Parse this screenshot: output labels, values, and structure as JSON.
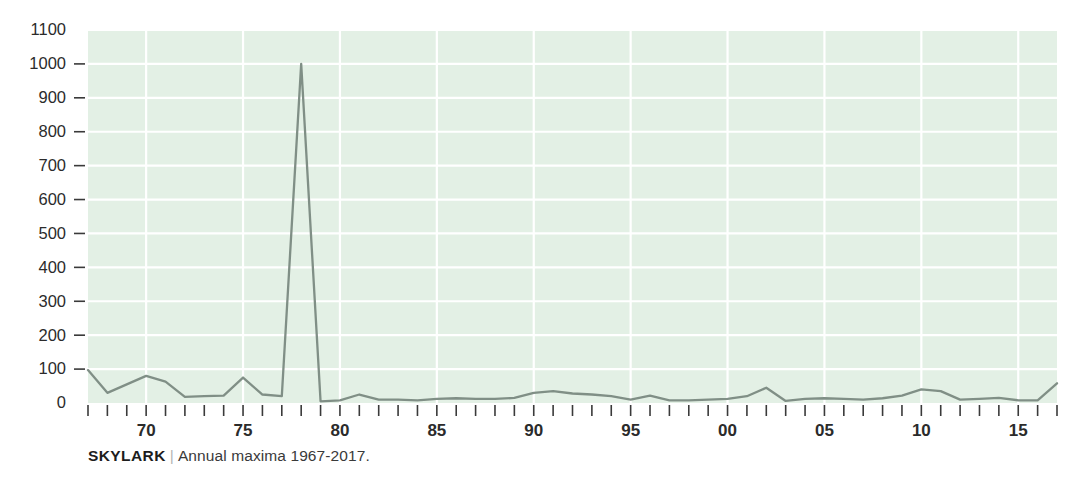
{
  "caption": {
    "title": "SKYLARK",
    "separator": "|",
    "subtitle": "Annual maxima 1967-2017."
  },
  "colors": {
    "plot_background": "#e3f0e5",
    "gridline": "#ffffff",
    "line": "#808f86",
    "axis_text": "#2b2b2b",
    "page_background": "#ffffff",
    "caption_title": "#1d1d1d",
    "caption_separator": "#b4b4b4"
  },
  "chart_data": {
    "type": "line",
    "title": "SKYLARK",
    "subtitle": "Annual maxima 1967-2017.",
    "xlabel": "",
    "ylabel": "",
    "grid": true,
    "legend": null,
    "ylim": [
      0,
      1100
    ],
    "xlim": [
      1967,
      2017
    ],
    "yticks": [
      0,
      100,
      200,
      300,
      400,
      500,
      600,
      700,
      800,
      900,
      1000,
      1100
    ],
    "ytick_labels": [
      "0",
      "100",
      "200",
      "300",
      "400",
      "500",
      "600",
      "700",
      "800",
      "900",
      "1000",
      "1100"
    ],
    "xticks": [
      1967,
      1968,
      1969,
      1970,
      1971,
      1972,
      1973,
      1974,
      1975,
      1976,
      1977,
      1978,
      1979,
      1980,
      1981,
      1982,
      1983,
      1984,
      1985,
      1986,
      1987,
      1988,
      1989,
      1990,
      1991,
      1992,
      1993,
      1994,
      1995,
      1996,
      1997,
      1998,
      1999,
      2000,
      2001,
      2002,
      2003,
      2004,
      2005,
      2006,
      2007,
      2008,
      2009,
      2010,
      2011,
      2012,
      2013,
      2014,
      2015,
      2016,
      2017
    ],
    "xtick_labels": [
      {
        "year": 1970,
        "label": "70"
      },
      {
        "year": 1975,
        "label": "75"
      },
      {
        "year": 1980,
        "label": "80"
      },
      {
        "year": 1985,
        "label": "85"
      },
      {
        "year": 1990,
        "label": "90"
      },
      {
        "year": 1995,
        "label": "95"
      },
      {
        "year": 2000,
        "label": "00"
      },
      {
        "year": 2005,
        "label": "05"
      },
      {
        "year": 2010,
        "label": "10"
      },
      {
        "year": 2015,
        "label": "15"
      }
    ],
    "x": [
      1967,
      1968,
      1969,
      1970,
      1971,
      1972,
      1973,
      1974,
      1975,
      1976,
      1977,
      1978,
      1979,
      1980,
      1981,
      1982,
      1983,
      1984,
      1985,
      1986,
      1987,
      1988,
      1989,
      1990,
      1991,
      1992,
      1993,
      1994,
      1995,
      1996,
      1997,
      1998,
      1999,
      2000,
      2001,
      2002,
      2003,
      2004,
      2005,
      2006,
      2007,
      2008,
      2009,
      2010,
      2011,
      2012,
      2013,
      2014,
      2015,
      2016,
      2017
    ],
    "values": [
      97,
      30,
      55,
      80,
      63,
      18,
      20,
      22,
      75,
      25,
      20,
      1000,
      5,
      8,
      25,
      10,
      10,
      8,
      12,
      14,
      12,
      12,
      15,
      30,
      35,
      28,
      25,
      20,
      10,
      22,
      8,
      8,
      10,
      12,
      20,
      45,
      6,
      12,
      14,
      12,
      10,
      14,
      22,
      40,
      35,
      10,
      12,
      15,
      8,
      8,
      58
    ],
    "series": [
      {
        "name": "Annual maxima",
        "values": [
          97,
          30,
          55,
          80,
          63,
          18,
          20,
          22,
          75,
          25,
          20,
          1000,
          5,
          8,
          25,
          10,
          10,
          8,
          12,
          14,
          12,
          12,
          15,
          30,
          35,
          28,
          25,
          20,
          10,
          22,
          8,
          8,
          10,
          12,
          20,
          45,
          6,
          12,
          14,
          12,
          10,
          14,
          22,
          40,
          35,
          10,
          12,
          15,
          8,
          8,
          58
        ]
      }
    ],
    "annotations": [
      {
        "text": "Peak of 1000 in 1978",
        "x": 1978,
        "y": 1000
      }
    ]
  }
}
